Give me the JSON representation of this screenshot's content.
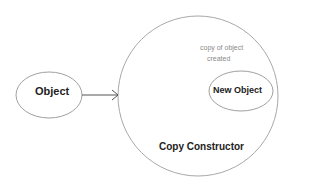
{
  "diagram": {
    "nodes": {
      "object": {
        "label": "Object"
      },
      "copy_constructor": {
        "label": "Copy Constructor"
      },
      "new_object": {
        "label": "New Object"
      }
    },
    "annotation": {
      "line1": "copy of object",
      "line2": "created"
    },
    "edges": [
      {
        "from": "Object",
        "to": "Copy Constructor"
      }
    ],
    "colors": {
      "stroke": "#9a9a9a",
      "arrow": "#555555",
      "text": "#222222",
      "annotation": "#8a8a8a"
    }
  }
}
